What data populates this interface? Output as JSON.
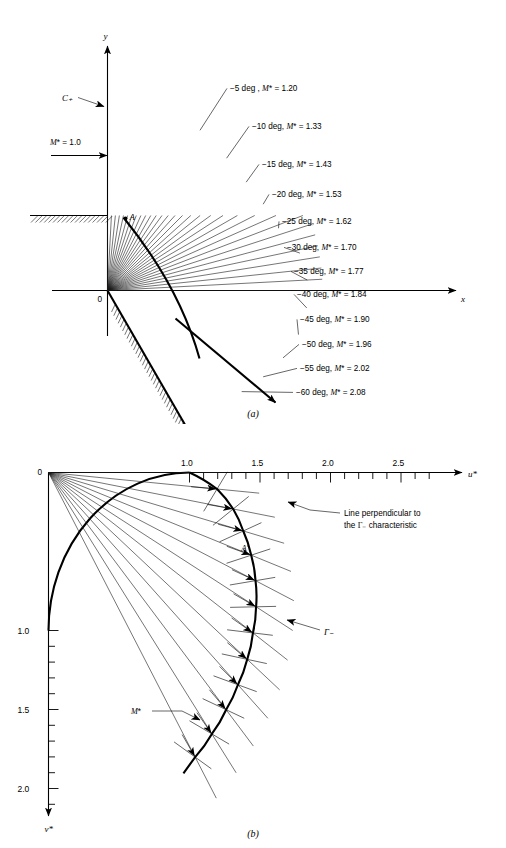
{
  "figure": {
    "caption_a": "(a)",
    "caption_b": "(b)"
  },
  "panel_a": {
    "name": "prandtl-meyer-expansion-fan-physical-plane",
    "axis_x_label": "x",
    "axis_y_label": "y",
    "origin_label": "0",
    "point_label": "A",
    "characteristic_label": "C₊",
    "inflow_label": "M* = 1.0",
    "ray_labels": [
      "−5 deg , M* = 1.20",
      "−10 deg, M* = 1.33",
      "−15 deg, M* = 1.43",
      "−20 deg, M* = 1.53",
      "−25 deg, M* = 1.62",
      "−30 deg, M* = 1.70",
      "−35 deg, M* = 1.77",
      "−40 deg, M* = 1.84",
      "−45 deg, M* = 1.90",
      "−50 deg, M* = 1.96",
      "−55 deg, M* = 2.02",
      "−60 deg, M* = 2.08"
    ]
  },
  "panel_b": {
    "name": "hodograph-plane",
    "axis_u_label": "u*",
    "axis_v_label": "v*",
    "origin_label": "0",
    "point_label": "A′",
    "gamma_label": "Γ₋",
    "mstar_label": "M*",
    "annotation_line1": "Line perpendicular to",
    "annotation_line2": "the Γ₋ characteristic",
    "u_tick_labels": [
      "1.0",
      "1.5",
      "2.0",
      "2.5"
    ],
    "v_tick_labels": [
      "1.0",
      "1.5",
      "2.0"
    ]
  },
  "chart_data": {
    "type": "line",
    "subcharts": [
      {
        "id": "a",
        "title": "(a)",
        "xlabel": "x",
        "ylabel": "y",
        "description": "Centered expansion fan at a convex corner; each characteristic ray labeled with flow deflection angle and M*",
        "rays": [
          {
            "deg": -5,
            "mstar": 1.2
          },
          {
            "deg": -10,
            "mstar": 1.33
          },
          {
            "deg": -15,
            "mstar": 1.43
          },
          {
            "deg": -20,
            "mstar": 1.53
          },
          {
            "deg": -25,
            "mstar": 1.62
          },
          {
            "deg": -30,
            "mstar": 1.7
          },
          {
            "deg": -35,
            "mstar": 1.77
          },
          {
            "deg": -40,
            "mstar": 1.84
          },
          {
            "deg": -45,
            "mstar": 1.9
          },
          {
            "deg": -50,
            "mstar": 1.96
          },
          {
            "deg": -55,
            "mstar": 2.02
          },
          {
            "deg": -60,
            "mstar": 2.08
          }
        ],
        "inflow_mstar": 1.0,
        "wall_turn_deg": -60
      },
      {
        "id": "b",
        "title": "(b)",
        "xlabel": "u*",
        "ylabel": "v*",
        "description": "Hodograph plane with the gamma-minus epicycloid characteristic and perpendicular lines",
        "xlim": [
          0,
          2.75
        ],
        "ylim": [
          0,
          2.2
        ],
        "x_major_ticks": [
          1.0,
          1.5,
          2.0,
          2.5
        ],
        "y_major_ticks": [
          1.0,
          1.5,
          2.0
        ],
        "minor_tick_step": 0.1,
        "sonic_circle_radius": 1.0,
        "hodograph_points": [
          {
            "deg": 0,
            "mstar": 1.0
          },
          {
            "deg": -5,
            "mstar": 1.2
          },
          {
            "deg": -10,
            "mstar": 1.33
          },
          {
            "deg": -15,
            "mstar": 1.43
          },
          {
            "deg": -20,
            "mstar": 1.53
          },
          {
            "deg": -25,
            "mstar": 1.62
          },
          {
            "deg": -30,
            "mstar": 1.7
          },
          {
            "deg": -35,
            "mstar": 1.77
          },
          {
            "deg": -40,
            "mstar": 1.84
          },
          {
            "deg": -45,
            "mstar": 1.9
          },
          {
            "deg": -50,
            "mstar": 1.96
          },
          {
            "deg": -55,
            "mstar": 2.02
          },
          {
            "deg": -60,
            "mstar": 2.08
          }
        ]
      }
    ]
  }
}
